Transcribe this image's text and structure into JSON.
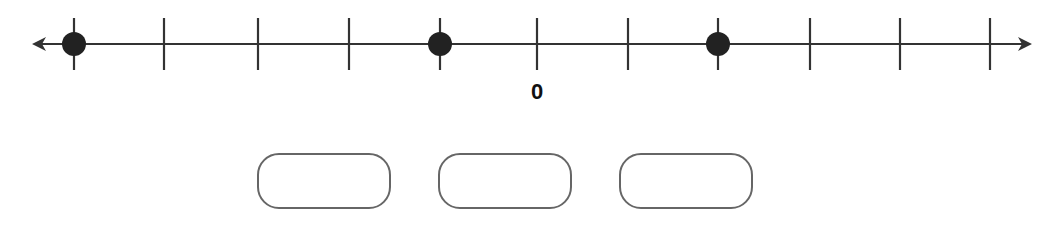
{
  "number_line": {
    "tick_count": 11,
    "zero_label": "0",
    "zero_tick_index": 5,
    "dot_tick_indices": [
      0,
      4,
      7
    ],
    "colors": {
      "line": "#333333",
      "dot": "#222222"
    }
  },
  "answer_boxes": [
    {
      "value": ""
    },
    {
      "value": ""
    },
    {
      "value": ""
    }
  ]
}
